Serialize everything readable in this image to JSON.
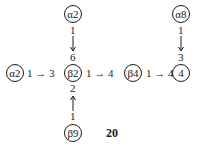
{
  "diagram": {
    "nodes": [
      {
        "id": "a2_top",
        "label": "α2",
        "x": 73,
        "y": 14
      },
      {
        "id": "a2_left",
        "label": "α2",
        "x": 15,
        "y": 73
      },
      {
        "id": "b2",
        "label": "β2",
        "x": 73,
        "y": 73
      },
      {
        "id": "b4",
        "label": "β4",
        "x": 133,
        "y": 73
      },
      {
        "id": "n4",
        "label": "4",
        "x": 181,
        "y": 73
      },
      {
        "id": "a8",
        "label": "α8",
        "x": 181,
        "y": 14
      },
      {
        "id": "b9",
        "label": "β9",
        "x": 73,
        "y": 133
      }
    ],
    "edges": [
      {
        "from": "a2_left",
        "to": "b2",
        "label": "1 → 3"
      },
      {
        "from": "b2",
        "to": "b4",
        "label": "1 → 4"
      },
      {
        "from": "b4",
        "to": "n4",
        "label": "1 → 4"
      },
      {
        "from": "a2_top",
        "to": "b2",
        "from_pos": "1",
        "to_pos": "6"
      },
      {
        "from": "b9",
        "to": "b2",
        "from_pos": "1",
        "to_pos": "2"
      },
      {
        "from": "a8",
        "to": "n4",
        "from_pos": "1",
        "to_pos": "3"
      }
    ],
    "caption": "20"
  }
}
